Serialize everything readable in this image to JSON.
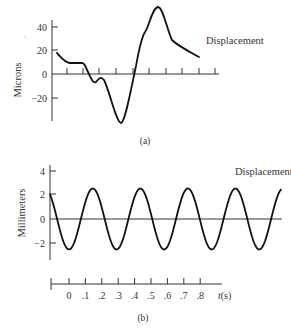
{
  "chart_data": [
    {
      "panel": "(a)",
      "type": "line",
      "title": "",
      "xlabel": "",
      "ylabel": "Microns",
      "ylim": [
        -40,
        55
      ],
      "yticks": [
        40,
        20,
        0,
        -20
      ],
      "ytick_labels": [
        "40",
        "20",
        "0",
        "−20"
      ],
      "x_tick_count": 10,
      "grid": false,
      "legend": "Displacement",
      "series": [
        {
          "name": "Displacement",
          "x_px": [
            57,
            68,
            83,
            88,
            95,
            102,
            121,
            135,
            145,
            158,
            175,
            199
          ],
          "values": [
            17,
            9,
            9,
            1,
            -7,
            -3,
            -40,
            0,
            34,
            55,
            26,
            14
          ]
        }
      ]
    },
    {
      "panel": "(b)",
      "type": "line",
      "title": "",
      "xlabel": "t(s)",
      "ylabel": "Millimeters",
      "ylim": [
        -2.5,
        4
      ],
      "yticks": [
        4,
        2,
        0,
        -2
      ],
      "ytick_labels": [
        "4",
        "2",
        "0",
        "−2"
      ],
      "xticks": [
        0,
        0.1,
        0.2,
        0.3,
        0.4,
        0.5,
        0.6,
        0.7,
        0.8
      ],
      "xtick_labels": [
        "0",
        ".1",
        ".2",
        ".3",
        ".4",
        ".5",
        ".6",
        ".7",
        ".8"
      ],
      "grid": false,
      "legend": "Displacement",
      "series": [
        {
          "name": "Displacement",
          "waveform": "sinusoid",
          "amplitude_mm": 2.5,
          "period_s": 0.29,
          "troughs_t": [
            0.0,
            0.28,
            0.57,
            0.86,
            1.15
          ],
          "peaks_t": [
            0.14,
            0.43,
            0.71,
            1.0
          ]
        }
      ]
    }
  ],
  "labels": {
    "a": {
      "ylabel": "Microns",
      "series": "Displacement",
      "panel": "(a)",
      "yticks": [
        "40",
        "20",
        "0",
        "−20"
      ]
    },
    "b": {
      "ylabel": "Millimeters",
      "series": "Displacement",
      "panel": "(b)",
      "yticks": [
        "4",
        "2",
        "0",
        "−2"
      ],
      "xticks": [
        "0",
        ".1",
        ".2",
        ".3",
        ".4",
        ".5",
        ".6",
        ".7",
        ".8"
      ],
      "xlabel_t": "t",
      "xlabel_unit": "(s)"
    }
  }
}
